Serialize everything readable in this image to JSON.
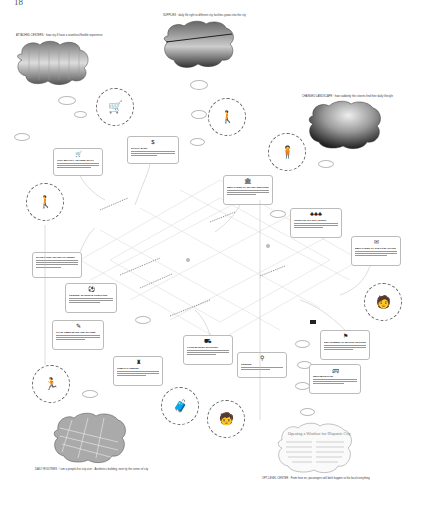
{
  "page_number": "18",
  "captions": {
    "top_left": "ATTACHED CENTERS  ·  how city ill have a seamless/flexible experience",
    "top_center": "SUPPLIES  ·  daily life right to different city facilities grows into the city",
    "top_right": "CHANGED LANDSCAPE  ·  how suddenly the citizens find their daily lifestyle",
    "bottom_left": "DAILY ROUTINES  ·  I am a people-first city user  ·  Aesthetics building, next try the center of city",
    "bottom_right": "OPT-LEVEL CENTER  ·  From here on, passengers will both happen to the local everything"
  },
  "cloud_images": [
    {
      "id": "market-interior",
      "label": "market hall interior photo"
    },
    {
      "id": "train-aerial",
      "label": "aerial view of train station"
    },
    {
      "id": "landscape",
      "label": "tree landscape photo"
    },
    {
      "id": "city-aerial",
      "label": "dense city aerial photo"
    },
    {
      "id": "newspaper",
      "label": "Opening a Window for Hispanic City"
    }
  ],
  "cards": [
    {
      "icon": "🛒",
      "title": "HIGH QUALITY, TRAINED STAFF"
    },
    {
      "icon": "$",
      "title": "SOCIAL BANK"
    },
    {
      "icon": "🏛",
      "title": "EMPLOYEES OF TRAVEL SERVICES"
    },
    {
      "icon": "♣♣♣",
      "title": "OUTDOOR CHARITY EVENT"
    },
    {
      "icon": "✉",
      "title": "EMPLOYEES OF THE POST OFFICE"
    },
    {
      "icon": "☰",
      "title": "SLOW GOING TRAVEL PLANNING"
    },
    {
      "icon": "⚽",
      "title": "LEISURE, SPORTS & OUTDOORS"
    },
    {
      "icon": "✎",
      "title": "GOOD TIMES MADE AND SHARED"
    },
    {
      "icon": "♜",
      "title": "PUBLIC GARDENS"
    },
    {
      "icon": "⛟",
      "title": "FOOD MARKET SHOPPING"
    },
    {
      "icon": "⚲",
      "title": "LEISURE"
    },
    {
      "icon": "⚑",
      "title": "DEPARTMENT OF MOTOR VEHICLES"
    },
    {
      "icon": "🚌",
      "title": "NEIGHBORHOOD"
    }
  ],
  "figures": [
    {
      "id": "shopper",
      "glyph": "🛒"
    },
    {
      "id": "standing-person",
      "glyph": "🚶"
    },
    {
      "id": "woman-right",
      "glyph": "🧍"
    },
    {
      "id": "walker-left",
      "glyph": "🚶"
    },
    {
      "id": "postman",
      "glyph": "🧑"
    },
    {
      "id": "runner",
      "glyph": "🏃"
    },
    {
      "id": "traveler",
      "glyph": "🧳"
    },
    {
      "id": "child",
      "glyph": "🧒"
    }
  ]
}
